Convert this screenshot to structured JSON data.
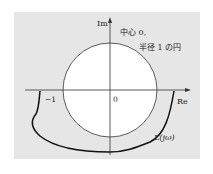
{
  "figure": {
    "axes": {
      "real_label": "Re",
      "imag_label": "Im",
      "origin_label": "0",
      "minus_one_label": "−1"
    },
    "circle_annotation": {
      "line1": "中心 0,",
      "line2": "半径 1 の円"
    },
    "curve_label": "L(jω)",
    "colors": {
      "panel_background": "#e6e6e6",
      "circle_fill": "#ffffff",
      "stroke": "#222222"
    }
  }
}
